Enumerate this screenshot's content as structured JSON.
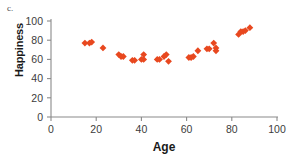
{
  "panel": {
    "label": "c."
  },
  "chart_data": {
    "type": "scatter",
    "title": "",
    "xlabel": "Age",
    "ylabel": "Happiness",
    "xlim": [
      0,
      100
    ],
    "ylim": [
      0,
      100
    ],
    "xticks": [
      0,
      20,
      40,
      60,
      80,
      100
    ],
    "yticks": [
      0,
      20,
      40,
      60,
      80,
      100
    ],
    "xtick_labels": [
      "0",
      "20",
      "40",
      "60",
      "80",
      "100"
    ],
    "ytick_labels": [
      "0",
      "20",
      "40",
      "60",
      "80",
      "100"
    ],
    "grid": false,
    "legend": false,
    "marker": "diamond",
    "marker_color": "#e8481f",
    "series": [
      {
        "name": "Happiness by age",
        "points": [
          [
            15,
            77
          ],
          [
            17,
            77
          ],
          [
            18,
            78
          ],
          [
            23,
            72
          ],
          [
            30,
            65
          ],
          [
            31,
            63
          ],
          [
            32,
            63
          ],
          [
            36,
            59
          ],
          [
            37,
            59
          ],
          [
            40,
            60
          ],
          [
            41,
            65
          ],
          [
            41,
            60
          ],
          [
            47,
            60
          ],
          [
            48,
            60
          ],
          [
            50,
            63
          ],
          [
            51,
            65
          ],
          [
            52,
            58
          ],
          [
            61,
            62
          ],
          [
            62,
            62
          ],
          [
            63,
            63
          ],
          [
            65,
            69
          ],
          [
            69,
            71
          ],
          [
            70,
            71
          ],
          [
            72,
            77
          ],
          [
            73,
            72
          ],
          [
            73,
            69
          ],
          [
            83,
            86
          ],
          [
            84,
            89
          ],
          [
            85,
            89
          ],
          [
            86,
            90
          ],
          [
            88,
            93
          ]
        ]
      }
    ]
  }
}
